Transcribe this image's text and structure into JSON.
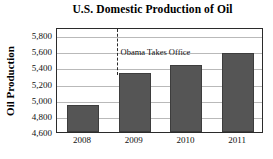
{
  "chart_data": {
    "type": "bar",
    "title": "U.S. Domestic Production of Oil",
    "xlabel": "",
    "ylabel": "Oil Production",
    "categories": [
      "2008",
      "2009",
      "2010",
      "2011"
    ],
    "values": [
      4940,
      5330,
      5430,
      5580
    ],
    "ylim": [
      4600,
      5900
    ],
    "yticks": [
      4600,
      4800,
      5000,
      5200,
      5400,
      5600,
      5800
    ],
    "ytick_labels": [
      "4,600",
      "4,800",
      "5,000",
      "5,200",
      "5,400",
      "5,600",
      "5,800"
    ],
    "grid": true,
    "legend": false,
    "bar_color": "#555555",
    "bar_edge_color": "#3d3d3d",
    "frame_color": "#2b2b2b",
    "gridline_color": "#b9b9b9",
    "annotations": [
      {
        "text": "Obama Takes Office",
        "type": "vertical-dashed-line",
        "x_position": 2008.65,
        "line_color": "#2b2b2b"
      }
    ]
  }
}
